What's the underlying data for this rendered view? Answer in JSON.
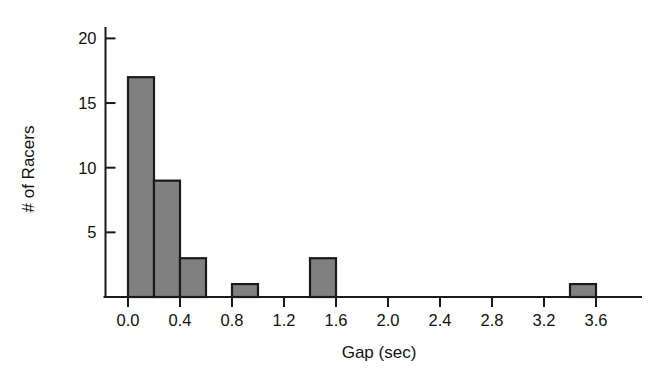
{
  "chart_data": {
    "type": "bar",
    "subtype": "histogram",
    "title": "",
    "xlabel": "Gap (sec)",
    "ylabel": "# of Racers",
    "xlim": [
      -0.2,
      3.95
    ],
    "ylim": [
      0,
      21.5
    ],
    "grid": false,
    "legend": null,
    "bin_width": 0.2,
    "x_ticks": [
      "0.0",
      "0.4",
      "0.8",
      "1.2",
      "1.6",
      "2.0",
      "2.4",
      "2.8",
      "3.2",
      "3.6"
    ],
    "x_tick_values": [
      0.0,
      0.4,
      0.8,
      1.2,
      1.6,
      2.0,
      2.4,
      2.8,
      3.2,
      3.6
    ],
    "y_ticks": [
      "5",
      "10",
      "15",
      "20"
    ],
    "y_tick_values": [
      5,
      10,
      15,
      20
    ],
    "bins": [
      {
        "start": 0.0,
        "end": 0.2,
        "count": 17
      },
      {
        "start": 0.2,
        "end": 0.4,
        "count": 9
      },
      {
        "start": 0.4,
        "end": 0.6,
        "count": 3
      },
      {
        "start": 0.6,
        "end": 0.8,
        "count": 0
      },
      {
        "start": 0.8,
        "end": 1.0,
        "count": 1
      },
      {
        "start": 1.0,
        "end": 1.2,
        "count": 0
      },
      {
        "start": 1.2,
        "end": 1.4,
        "count": 0
      },
      {
        "start": 1.4,
        "end": 1.6,
        "count": 3
      },
      {
        "start": 1.6,
        "end": 1.8,
        "count": 0
      },
      {
        "start": 1.8,
        "end": 2.0,
        "count": 0
      },
      {
        "start": 2.0,
        "end": 2.2,
        "count": 0
      },
      {
        "start": 2.2,
        "end": 2.4,
        "count": 0
      },
      {
        "start": 2.4,
        "end": 2.6,
        "count": 0
      },
      {
        "start": 2.6,
        "end": 2.8,
        "count": 0
      },
      {
        "start": 2.8,
        "end": 3.0,
        "count": 0
      },
      {
        "start": 3.0,
        "end": 3.2,
        "count": 0
      },
      {
        "start": 3.2,
        "end": 3.4,
        "count": 0
      },
      {
        "start": 3.4,
        "end": 3.6,
        "count": 1
      },
      {
        "start": 3.6,
        "end": 3.8,
        "count": 0
      }
    ],
    "categories": [
      "0.0-0.2",
      "0.2-0.4",
      "0.4-0.6",
      "0.6-0.8",
      "0.8-1.0",
      "1.0-1.2",
      "1.2-1.4",
      "1.4-1.6",
      "1.6-1.8",
      "1.8-2.0",
      "2.0-2.2",
      "2.2-2.4",
      "2.4-2.6",
      "2.6-2.8",
      "2.8-3.0",
      "3.0-3.2",
      "3.2-3.4",
      "3.4-3.6",
      "3.6-3.8"
    ],
    "values": [
      17,
      9,
      3,
      0,
      1,
      0,
      0,
      3,
      0,
      0,
      0,
      0,
      0,
      0,
      0,
      0,
      0,
      1,
      0
    ],
    "colors": {
      "bar_fill": "#808080",
      "bar_edge": "#1a1a1a",
      "axis": "#1a1a1a",
      "text": "#111111",
      "background": "#ffffff"
    }
  }
}
